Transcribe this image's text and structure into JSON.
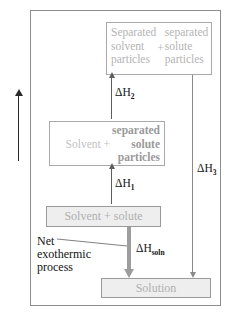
{
  "figure": {
    "axis": {
      "label": "Enthalpy",
      "arrow_icon": "arrow-up-icon",
      "direction": "up"
    },
    "boxes": {
      "separated": {
        "left_column": [
          "Separated",
          "solvent",
          "particles"
        ],
        "left_text": "Separated solvent particles",
        "plus": "+",
        "right_column": [
          "separated",
          "solute",
          "particles"
        ],
        "right_text": "separated solute particles"
      },
      "intermediate": {
        "left_text": "Solvent +",
        "right_column": [
          "separated",
          "solute",
          "particles"
        ],
        "right_text": "separated solute particles"
      },
      "reactant": {
        "label": "Solvent + solute",
        "fill": "#eeeeee"
      },
      "product": {
        "label": "Solution",
        "fill": "#eeeeee"
      }
    },
    "arrows": {
      "step1": {
        "label_delta": "ΔH",
        "label_sub": "1",
        "direction": "up"
      },
      "step2": {
        "label_delta": "ΔH",
        "label_sub": "2",
        "direction": "up"
      },
      "step3": {
        "label_delta": "ΔH",
        "label_sub": "3",
        "direction": "down"
      },
      "net": {
        "label_delta": "ΔH",
        "label_sub": "soln",
        "direction": "down"
      }
    },
    "annotation": {
      "lines": [
        "Net",
        "exothermic",
        "process"
      ],
      "text": "Net exothermic process"
    },
    "colors": {
      "frame_border": "#8d8d8d",
      "box_border": "#a9a9a9",
      "box_fill": "#eeeeee",
      "faded_text": "#b4b4b4",
      "dark_text": "#141414",
      "thin_arrow": "#5d5d5d",
      "thick_arrow": "#9d9d9d"
    }
  }
}
